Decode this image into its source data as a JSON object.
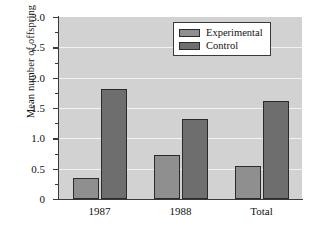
{
  "chart_data": {
    "type": "bar",
    "title": "",
    "xlabel": "",
    "ylabel": "Mean number of offspring",
    "categories": [
      "1987",
      "1988",
      "Total"
    ],
    "series": [
      {
        "name": "Experimental",
        "color": "#8f8f8f",
        "values": [
          0.35,
          0.72,
          0.55
        ]
      },
      {
        "name": "Control",
        "color": "#6e6e6e",
        "values": [
          1.81,
          1.32,
          1.61
        ]
      }
    ],
    "ylim": [
      0,
      3.0
    ],
    "ytick_labels": [
      "0",
      "0.5",
      "1.0",
      "1.5",
      "2.0",
      "2.5",
      "3.0"
    ],
    "ytick_values": [
      0,
      0.5,
      1.0,
      1.5,
      2.0,
      2.5,
      3.0
    ],
    "yminor_values": [
      0.25,
      0.75,
      1.25,
      1.75,
      2.25,
      2.75
    ],
    "grid": "horizontal",
    "legend_position": "top-right",
    "plot_background": "#d2d2d2",
    "gridline_color": "#f2f2f2",
    "axis_color": "#3a3a3a"
  }
}
